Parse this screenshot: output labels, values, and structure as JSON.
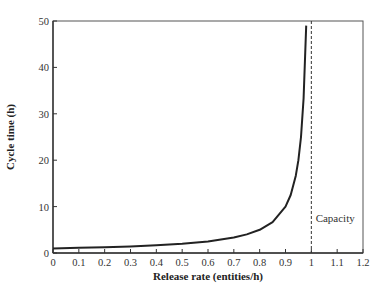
{
  "chart_data": {
    "type": "line",
    "title": "",
    "xlabel": "Release rate (entities/h)",
    "ylabel": "Cycle time (h)",
    "xlim": [
      0,
      1.2
    ],
    "ylim": [
      0,
      50
    ],
    "grid": false,
    "legend": null,
    "x_ticks": [
      0,
      0.1,
      0.2,
      0.3,
      0.4,
      0.5,
      0.6,
      0.7,
      0.8,
      0.9,
      1,
      1.1,
      1.2
    ],
    "x_tick_labels": [
      "0",
      "0.1",
      "0.2",
      "0.3",
      "0.4",
      "0.5",
      "0.6",
      "0.7",
      "0.8",
      "0.9",
      "1",
      "1.1",
      "1.2"
    ],
    "y_ticks": [
      0,
      10,
      20,
      30,
      40,
      50
    ],
    "y_tick_labels": [
      "0",
      "10",
      "20",
      "30",
      "40",
      "50"
    ],
    "series": [
      {
        "name": "Cycle time",
        "style": "solid",
        "color": "#222222",
        "x": [
          0,
          0.1,
          0.2,
          0.3,
          0.4,
          0.5,
          0.6,
          0.7,
          0.75,
          0.8,
          0.85,
          0.9,
          0.92,
          0.94,
          0.95,
          0.96,
          0.97,
          0.98
        ],
        "y": [
          1.0,
          1.11,
          1.25,
          1.43,
          1.67,
          2.0,
          2.5,
          3.33,
          4.0,
          5.0,
          6.67,
          10.0,
          12.5,
          16.67,
          20.0,
          25.0,
          33.33,
          49.0
        ]
      }
    ],
    "reference_lines": [
      {
        "orientation": "vertical",
        "x": 1.0,
        "style": "dashed",
        "color": "#333333",
        "label": "Capacity"
      }
    ],
    "annotations": [
      {
        "text": "Capacity",
        "x": 1.005,
        "y": 7.5
      }
    ]
  }
}
